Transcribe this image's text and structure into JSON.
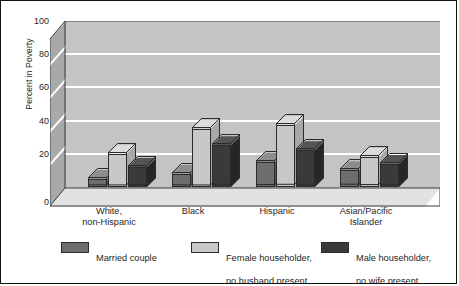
{
  "chart_data": {
    "type": "bar",
    "title": "",
    "subtitle": "",
    "xlabel": "",
    "ylabel": "Percent in Poverty",
    "ylim": [
      0,
      100
    ],
    "yticks": [
      0,
      20,
      40,
      60,
      80,
      100
    ],
    "grid": true,
    "grid_axis": "y",
    "legend_position": "bottom",
    "style_3d": true,
    "categories": [
      "White,\nnon-Hispanic",
      "Black",
      "Hispanic",
      "Asian/Pacific\nIslander"
    ],
    "category_lines": [
      [
        "White,",
        "non-Hispanic"
      ],
      [
        "Black",
        ""
      ],
      [
        "Hispanic",
        ""
      ],
      [
        "Asian/Pacific",
        "Islander"
      ]
    ],
    "series": [
      {
        "name": "Married couple",
        "name_lines": [
          "Married couple",
          ""
        ],
        "color": "#6e6e6e",
        "top_color": "#8d8d8d",
        "side_color": "#565656",
        "values": [
          5,
          8,
          15,
          10
        ]
      },
      {
        "name": "Female householder, no husband present",
        "name_lines": [
          "Female householder,",
          "no husband present"
        ],
        "color": "#c8c8c8",
        "top_color": "#dcdcdc",
        "side_color": "#a8a8a8",
        "values": [
          20,
          35,
          37,
          18
        ]
      },
      {
        "name": "Male householder, no wife present",
        "name_lines": [
          "Male householder,",
          "no wife present"
        ],
        "color": "#3a3a3a",
        "top_color": "#555555",
        "side_color": "#262626",
        "values": [
          12,
          25,
          22,
          14
        ]
      }
    ]
  },
  "axis": {
    "y_title": "Percent in Poverty",
    "tick_100": "100",
    "tick_80": "80",
    "tick_60": "60",
    "tick_40": "40",
    "tick_20": "20",
    "tick_0": "0"
  },
  "xaxis": {
    "cat0_line1": "White,",
    "cat0_line2": "non-Hispanic",
    "cat1_line1": "Black",
    "cat1_line2": "",
    "cat2_line1": "Hispanic",
    "cat2_line2": "",
    "cat3_line1": "Asian/Pacific",
    "cat3_line2": "Islander"
  },
  "legend": {
    "item0_line1": "Married couple",
    "item0_line2": "",
    "item1_line1": "Female householder,",
    "item1_line2": "no husband present",
    "item2_line1": "Male householder,",
    "item2_line2": "no wife present"
  }
}
